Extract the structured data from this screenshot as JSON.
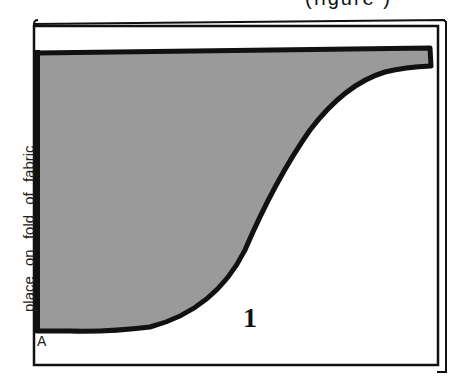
{
  "caption": {
    "partial_text": "(figure )"
  },
  "pattern": {
    "fold_label": "place on fold of fabric",
    "point_label": "A",
    "piece_number": "1",
    "fill_color": "#9a9a9a",
    "outline_color": "#111111"
  }
}
